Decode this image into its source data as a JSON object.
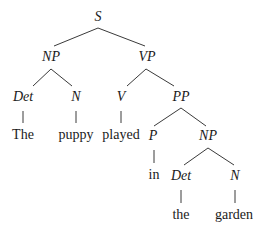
{
  "diagram": {
    "type": "syntax-tree",
    "sentence": "The puppy played in the garden",
    "colors": {
      "line": "#3a3a3a",
      "text": "#1a1a1a",
      "background": "#ffffff"
    },
    "nodes": [
      {
        "id": "S",
        "label": "S",
        "kind": "category",
        "x": 98,
        "y": 18
      },
      {
        "id": "NP1",
        "label": "NP",
        "kind": "category",
        "x": 51,
        "y": 58
      },
      {
        "id": "VP",
        "label": "VP",
        "kind": "category",
        "x": 147,
        "y": 58
      },
      {
        "id": "Det1",
        "label": "Det",
        "kind": "category",
        "x": 23,
        "y": 98
      },
      {
        "id": "N1",
        "label": "N",
        "kind": "category",
        "x": 76,
        "y": 98
      },
      {
        "id": "V",
        "label": "V",
        "kind": "category",
        "x": 121,
        "y": 98
      },
      {
        "id": "PP",
        "label": "PP",
        "kind": "category",
        "x": 181,
        "y": 98
      },
      {
        "id": "w_the1",
        "label": "The",
        "kind": "word",
        "x": 23,
        "y": 136
      },
      {
        "id": "w_puppy",
        "label": "puppy",
        "kind": "word",
        "x": 76,
        "y": 136
      },
      {
        "id": "w_played",
        "label": "played",
        "kind": "word",
        "x": 121,
        "y": 136
      },
      {
        "id": "P",
        "label": "P",
        "kind": "category",
        "x": 153,
        "y": 137
      },
      {
        "id": "NP2",
        "label": "NP",
        "kind": "category",
        "x": 208,
        "y": 137
      },
      {
        "id": "w_in",
        "label": "in",
        "kind": "word",
        "x": 154,
        "y": 176
      },
      {
        "id": "Det2",
        "label": "Det",
        "kind": "category",
        "x": 181,
        "y": 177
      },
      {
        "id": "N2",
        "label": "N",
        "kind": "category",
        "x": 235,
        "y": 177
      },
      {
        "id": "w_the2",
        "label": "the",
        "kind": "word",
        "x": 181,
        "y": 216
      },
      {
        "id": "w_garden",
        "label": "garden",
        "kind": "word",
        "x": 234,
        "y": 216
      }
    ],
    "edges": [
      {
        "from": "S",
        "to": "NP1",
        "x1": 98,
        "y1": 28,
        "x2": 54,
        "y2": 46
      },
      {
        "from": "S",
        "to": "VP",
        "x1": 98,
        "y1": 28,
        "x2": 145,
        "y2": 46
      },
      {
        "from": "NP1",
        "to": "Det1",
        "x1": 51,
        "y1": 69,
        "x2": 33,
        "y2": 86
      },
      {
        "from": "NP1",
        "to": "N1",
        "x1": 51,
        "y1": 69,
        "x2": 72,
        "y2": 86
      },
      {
        "from": "VP",
        "to": "V",
        "x1": 146,
        "y1": 69,
        "x2": 127,
        "y2": 86
      },
      {
        "from": "VP",
        "to": "PP",
        "x1": 146,
        "y1": 69,
        "x2": 174,
        "y2": 86
      },
      {
        "from": "Det1",
        "to": "w_the1",
        "x1": 23,
        "y1": 111,
        "x2": 23,
        "y2": 123
      },
      {
        "from": "N1",
        "to": "w_puppy",
        "x1": 76,
        "y1": 111,
        "x2": 76,
        "y2": 123
      },
      {
        "from": "V",
        "to": "w_played",
        "x1": 121,
        "y1": 111,
        "x2": 121,
        "y2": 123
      },
      {
        "from": "PP",
        "to": "P",
        "x1": 181,
        "y1": 108,
        "x2": 154,
        "y2": 126
      },
      {
        "from": "PP",
        "to": "NP2",
        "x1": 181,
        "y1": 108,
        "x2": 206,
        "y2": 126
      },
      {
        "from": "P",
        "to": "w_in",
        "x1": 154,
        "y1": 150,
        "x2": 154,
        "y2": 163
      },
      {
        "from": "NP2",
        "to": "Det2",
        "x1": 208,
        "y1": 148,
        "x2": 184,
        "y2": 165
      },
      {
        "from": "NP2",
        "to": "N2",
        "x1": 208,
        "y1": 148,
        "x2": 234,
        "y2": 165
      },
      {
        "from": "Det2",
        "to": "w_the2",
        "x1": 181,
        "y1": 190,
        "x2": 181,
        "y2": 203
      },
      {
        "from": "N2",
        "to": "w_garden",
        "x1": 235,
        "y1": 190,
        "x2": 235,
        "y2": 203
      }
    ]
  }
}
